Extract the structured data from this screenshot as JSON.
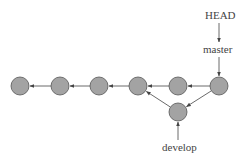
{
  "diagram": {
    "type": "git-branch-graph",
    "labels": {
      "head": "HEAD",
      "master": "master",
      "develop": "develop"
    },
    "colors": {
      "node_fill": "#a3a3a3",
      "node_stroke": "#555555",
      "edge": "#444444",
      "text": "#444444"
    },
    "nodes": [
      {
        "id": "c1",
        "x": 20,
        "y": 86
      },
      {
        "id": "c2",
        "x": 60,
        "y": 86
      },
      {
        "id": "c3",
        "x": 99,
        "y": 86
      },
      {
        "id": "c4",
        "x": 138,
        "y": 86
      },
      {
        "id": "c5",
        "x": 178,
        "y": 86
      },
      {
        "id": "c6",
        "x": 219,
        "y": 86
      },
      {
        "id": "d1",
        "x": 178,
        "y": 112
      }
    ],
    "edges": [
      {
        "from": "c2",
        "to": "c1"
      },
      {
        "from": "c3",
        "to": "c2"
      },
      {
        "from": "c4",
        "to": "c3"
      },
      {
        "from": "c5",
        "to": "c4"
      },
      {
        "from": "c6",
        "to": "c5"
      },
      {
        "from": "c6",
        "to": "d1"
      },
      {
        "from": "d1",
        "to": "c4"
      }
    ]
  }
}
